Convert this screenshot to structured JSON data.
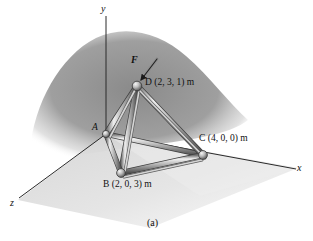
{
  "figure": {
    "caption": "(a)",
    "axes": [
      {
        "name": "y-axis",
        "label": "y",
        "x": 101,
        "y": 4
      },
      {
        "name": "x-axis",
        "label": "x",
        "x": 297,
        "y": 163
      },
      {
        "name": "z-axis",
        "label": "z",
        "x": 11,
        "y": 198
      }
    ],
    "force": {
      "label": "F",
      "label_x": 131,
      "label_y": 56,
      "tail_x": 157,
      "tail_y": 59,
      "head_x": 140,
      "head_y": 81
    },
    "nodes": [
      {
        "id": "A",
        "label": "A",
        "cx": 106,
        "cy": 134,
        "r": 3.4,
        "label_x": 92,
        "label_y": 125,
        "coords": ""
      },
      {
        "id": "B",
        "label": "B (2, 0, 3) m",
        "cx": 121,
        "cy": 173,
        "r": 4.2,
        "label_x": 104,
        "label_y": 180,
        "coords": "(2, 0, 3) m"
      },
      {
        "id": "C",
        "label": "C (4, 0, 0) m",
        "cx": 203,
        "cy": 155,
        "r": 4.2,
        "label_x": 200,
        "label_y": 136,
        "coords": "(4, 0, 0) m"
      },
      {
        "id": "D",
        "label": "D (2, 3, 1) m",
        "cx": 137,
        "cy": 86,
        "r": 4.6,
        "label_x": 145,
        "label_y": 79,
        "coords": "(2, 3, 1) m"
      }
    ],
    "members": [
      {
        "name": "member-AD",
        "from": "A",
        "to": "D"
      },
      {
        "name": "member-AB",
        "from": "A",
        "to": "B"
      },
      {
        "name": "member-AC",
        "from": "A",
        "to": "C"
      },
      {
        "name": "member-BD",
        "from": "B",
        "to": "D"
      },
      {
        "name": "member-BC",
        "from": "B",
        "to": "C"
      },
      {
        "name": "member-CD",
        "from": "C",
        "to": "D"
      }
    ],
    "colors": {
      "background": "#ffffff",
      "shadow": "#8d8d8d",
      "ground": "#c9c9c9",
      "member_light": "#e2e2e2",
      "member_mid": "#9a9a9a",
      "member_dark": "#565656",
      "axis": "#2a2a2a",
      "text": "#111111"
    }
  }
}
